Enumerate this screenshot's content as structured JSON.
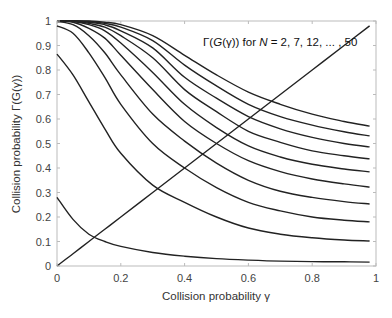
{
  "chart_data": {
    "type": "line",
    "title": "",
    "annotation": "Γ(G(γ)) for N = 2, 7, 12, ... , 50",
    "annotation_parts": {
      "pre": "Γ(",
      "g": "G",
      "mid": "(γ)) for ",
      "n": "N",
      "post": " = 2, 7, 12, ... , 50"
    },
    "xlabel": "Collision probability  γ",
    "ylabel": "Collision probability  Γ(G(γ))",
    "xlim": [
      0,
      1
    ],
    "ylim": [
      0,
      1
    ],
    "xticks": [
      "0",
      "0.2",
      "0.4",
      "0.6",
      "0.8",
      "1"
    ],
    "yticks": [
      "0",
      "0.1",
      "0.2",
      "0.3",
      "0.4",
      "0.5",
      "0.6",
      "0.7",
      "0.8",
      "0.9",
      "1"
    ],
    "grid": false,
    "x": [
      0,
      0.05,
      0.1,
      0.15,
      0.2,
      0.3,
      0.4,
      0.5,
      0.6,
      0.7,
      0.8,
      0.9,
      0.98
    ],
    "series": [
      {
        "name": "N=47",
        "values": [
          1,
          1,
          1,
          0.995,
          0.985,
          0.94,
          0.86,
          0.78,
          0.71,
          0.66,
          0.62,
          0.59,
          0.571
        ]
      },
      {
        "name": "N=42",
        "values": [
          1,
          1,
          0.998,
          0.99,
          0.975,
          0.92,
          0.82,
          0.735,
          0.66,
          0.61,
          0.575,
          0.548,
          0.531
        ]
      },
      {
        "name": "N=37",
        "values": [
          1,
          1,
          0.995,
          0.985,
          0.96,
          0.89,
          0.77,
          0.685,
          0.61,
          0.56,
          0.525,
          0.5,
          0.486
        ]
      },
      {
        "name": "N=32",
        "values": [
          1,
          1,
          0.99,
          0.975,
          0.94,
          0.85,
          0.72,
          0.63,
          0.55,
          0.505,
          0.47,
          0.45,
          0.437
        ]
      },
      {
        "name": "N=27",
        "values": [
          1,
          0.998,
          0.985,
          0.96,
          0.91,
          0.79,
          0.66,
          0.565,
          0.49,
          0.445,
          0.415,
          0.396,
          0.384
        ]
      },
      {
        "name": "N=22",
        "values": [
          1,
          0.995,
          0.97,
          0.93,
          0.86,
          0.72,
          0.59,
          0.5,
          0.43,
          0.385,
          0.355,
          0.335,
          0.322
        ]
      },
      {
        "name": "N=17",
        "values": [
          0.998,
          0.985,
          0.94,
          0.87,
          0.78,
          0.62,
          0.51,
          0.42,
          0.35,
          0.305,
          0.28,
          0.263,
          0.253
        ]
      },
      {
        "name": "N=12",
        "values": [
          0.98,
          0.95,
          0.87,
          0.77,
          0.66,
          0.5,
          0.4,
          0.32,
          0.26,
          0.225,
          0.2,
          0.187,
          0.18
        ]
      },
      {
        "name": "N=7",
        "values": [
          0.865,
          0.78,
          0.67,
          0.56,
          0.46,
          0.33,
          0.26,
          0.2,
          0.155,
          0.13,
          0.115,
          0.106,
          0.102
        ]
      },
      {
        "name": "N=2",
        "values": [
          0.28,
          0.19,
          0.13,
          0.1,
          0.08,
          0.055,
          0.04,
          0.03,
          0.024,
          0.02,
          0.018,
          0.017,
          0.016
        ]
      },
      {
        "name": "γ (identity)",
        "values": [
          0,
          0.05,
          0.1,
          0.15,
          0.2,
          0.3,
          0.4,
          0.5,
          0.6,
          0.7,
          0.8,
          0.9,
          0.98
        ]
      }
    ]
  }
}
